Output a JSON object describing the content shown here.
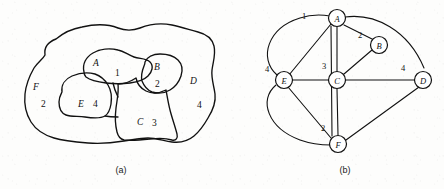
{
  "figure": {
    "panels": [
      {
        "id": "a",
        "caption": "(a)",
        "kind": "region-map"
      },
      {
        "id": "b",
        "caption": "(b)",
        "kind": "graph"
      }
    ]
  },
  "map": {
    "regions": [
      {
        "letter": "A",
        "number": "1"
      },
      {
        "letter": "B",
        "number": "2"
      },
      {
        "letter": "C",
        "number": "3"
      },
      {
        "letter": "D",
        "number": "4"
      },
      {
        "letter": "E",
        "number": "4"
      },
      {
        "letter": "F",
        "number": "2"
      }
    ]
  },
  "graph": {
    "nodes": [
      {
        "id": "A",
        "label": "A"
      },
      {
        "id": "B",
        "label": "B"
      },
      {
        "id": "C",
        "label": "C"
      },
      {
        "id": "D",
        "label": "D"
      },
      {
        "id": "E",
        "label": "E"
      },
      {
        "id": "F",
        "label": "F"
      }
    ],
    "edge_labels": [
      {
        "edge": "A-E",
        "weight": "1"
      },
      {
        "edge": "A-B",
        "weight": "2"
      },
      {
        "edge": "A-C",
        "weight": "3"
      },
      {
        "edge": "E-F",
        "weight": "4"
      },
      {
        "edge": "C-D",
        "weight": "4"
      },
      {
        "edge": "C-F",
        "weight": "2"
      }
    ]
  },
  "colors": {
    "ink": "#111111",
    "paper": "#fdfdfc"
  }
}
